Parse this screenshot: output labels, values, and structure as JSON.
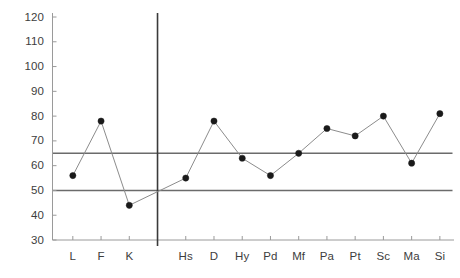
{
  "chart_data": {
    "type": "line",
    "title": "",
    "subtitle": "",
    "xlabel": "",
    "ylabel": "",
    "categories": [
      "L",
      "F",
      "K",
      "Hs",
      "D",
      "Hy",
      "Pd",
      "Mf",
      "Pa",
      "Pt",
      "Sc",
      "Ma",
      "Si"
    ],
    "values": [
      56,
      78,
      44,
      55,
      78,
      63,
      56,
      65,
      75,
      72,
      80,
      61,
      81
    ],
    "series": [
      {
        "name": "",
        "values": [
          56,
          78,
          44,
          55,
          78,
          63,
          56,
          65,
          75,
          72,
          80,
          61,
          81
        ]
      }
    ],
    "ylim": [
      30,
      120
    ],
    "xlim": [
      0,
      14
    ],
    "ytick_labels": [
      "120",
      "110",
      "100",
      "90",
      "80",
      "70",
      "60",
      "50",
      "40",
      "30"
    ],
    "ytick_values": [
      120,
      110,
      100,
      90,
      80,
      70,
      60,
      50,
      40,
      30
    ],
    "grid": false,
    "legend": "none",
    "marker": "filled-circle",
    "marker_color": "#1a1a1a",
    "line_color": "#8c8c8c",
    "axis_color": "#9a9a9a",
    "reference_lines": [
      {
        "value": 65,
        "label": "",
        "color": "#6b6b6b"
      },
      {
        "value": 50,
        "label": "",
        "color": "#6b6b6b"
      }
    ],
    "separator_lines": [
      {
        "after_category": "K",
        "color": "#3a3a3a"
      }
    ],
    "groups": [
      {
        "name": "",
        "categories": [
          "L",
          "F",
          "K"
        ]
      },
      {
        "name": "",
        "categories": [
          "Hs",
          "D",
          "Hy",
          "Pd",
          "Mf",
          "Pa",
          "Pt",
          "Sc",
          "Ma",
          "Si"
        ]
      }
    ],
    "gap_between_groups": true,
    "annotations": []
  }
}
